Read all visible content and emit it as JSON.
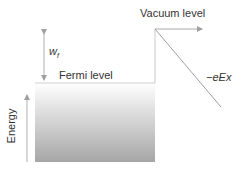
{
  "diagram": {
    "labels": {
      "vacuum_level": "Vacuum level",
      "fermi_level": "Fermi level",
      "work_function": "w",
      "work_function_sub": "f",
      "field_potential": "−eEx",
      "energy_axis": "Energy"
    },
    "colors": {
      "line": "#b0b0b0",
      "gradient_top": "#ffffff",
      "gradient_bottom": "#a8a8a8",
      "text": "#333333"
    }
  }
}
